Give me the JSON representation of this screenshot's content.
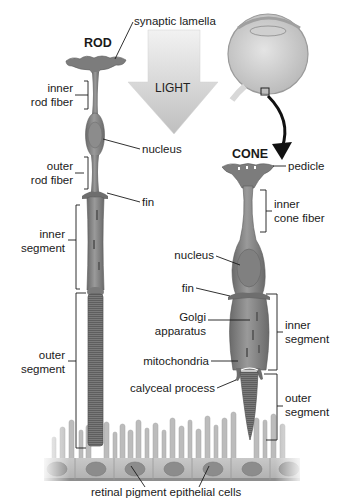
{
  "diagram": {
    "titles": {
      "rod": "ROD",
      "cone": "CONE",
      "light": "LIGHT"
    },
    "rod_labels": {
      "synaptic_lamella": "synaptic lamella",
      "inner_rod_fiber_1": "inner",
      "inner_rod_fiber_2": "rod fiber",
      "nucleus": "nucleus",
      "outer_rod_fiber_1": "outer",
      "outer_rod_fiber_2": "rod fiber",
      "fin": "fin",
      "inner_segment_1": "inner",
      "inner_segment_2": "segment",
      "outer_segment_1": "outer",
      "outer_segment_2": "segment"
    },
    "cone_labels": {
      "pedicle": "pedicle",
      "inner_cone_fiber_1": "inner",
      "inner_cone_fiber_2": "cone fiber",
      "nucleus": "nucleus",
      "fin": "fin",
      "golgi_1": "Golgi",
      "golgi_2": "apparatus",
      "mitochondria": "mitochondria",
      "calyceal_process": "calyceal process",
      "inner_segment_1": "inner",
      "inner_segment_2": "segment",
      "outer_segment_1": "outer",
      "outer_segment_2": "segment"
    },
    "bottom_label": "retinal pigment epithelial cells",
    "colors": {
      "cell_body": "#8a8a8a",
      "cell_dark": "#6e6e6e",
      "nucleus": "#777777",
      "arrow": "#c9c9c9",
      "epithelium": "#bdbdbd",
      "line": "#1a1a1a"
    }
  }
}
